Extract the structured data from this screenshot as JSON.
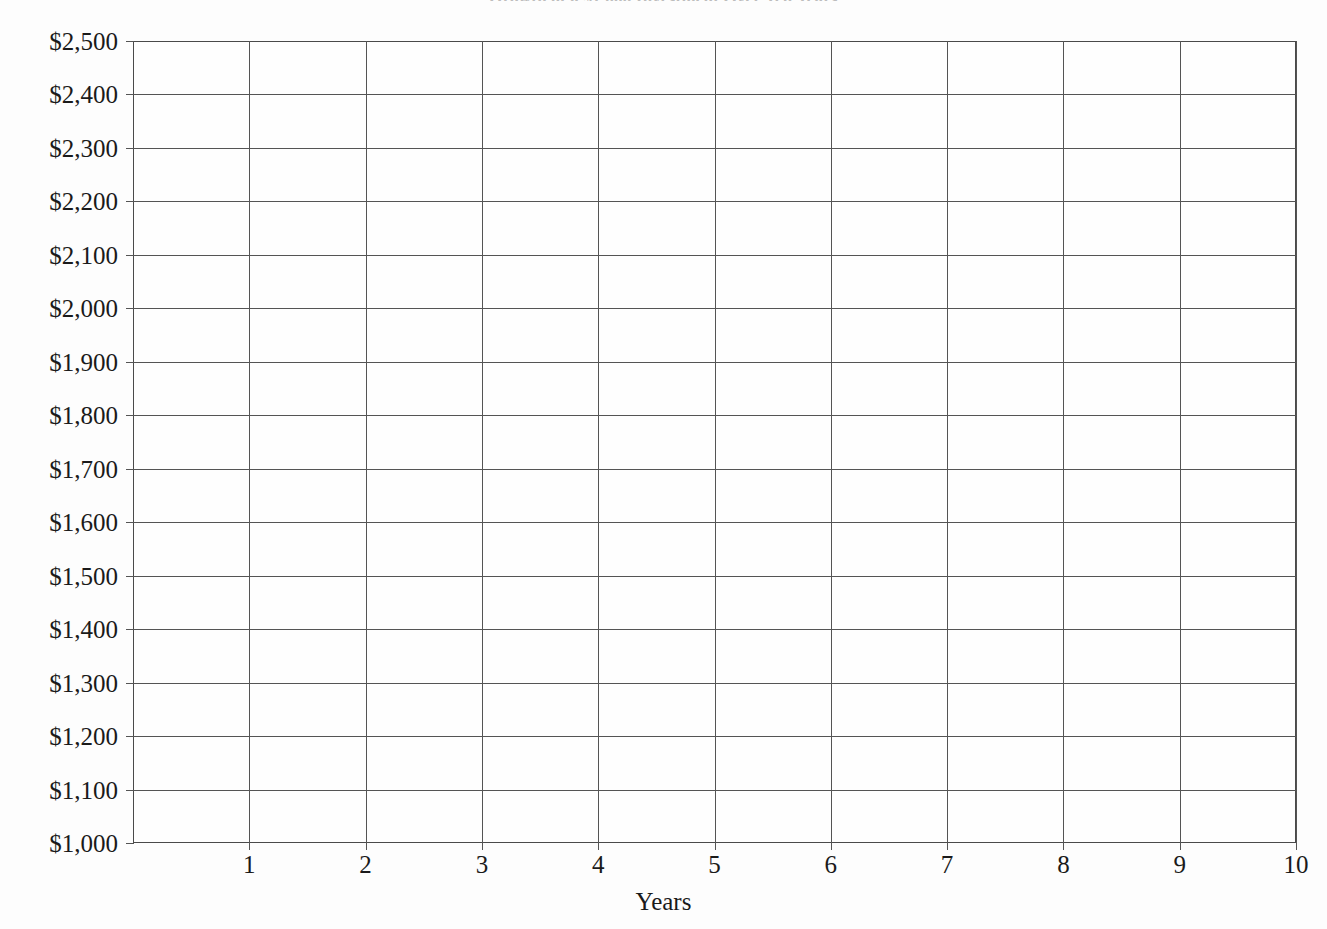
{
  "chart_data": {
    "type": "line",
    "title": "Growth of a $1,000 Investment Over Ten Years",
    "xlabel": "Years",
    "ylabel": "",
    "x": [
      0,
      1,
      2,
      3,
      4,
      5,
      6,
      7,
      8,
      9,
      10
    ],
    "series": [],
    "values": [],
    "categories": [],
    "xlim": [
      0,
      10
    ],
    "ylim": [
      1000,
      2500
    ],
    "xticks": [
      1,
      2,
      3,
      4,
      5,
      6,
      7,
      8,
      9,
      10
    ],
    "xtick_labels": [
      "1",
      "2",
      "3",
      "4",
      "5",
      "6",
      "7",
      "8",
      "9",
      "10"
    ],
    "yticks": [
      2500,
      2400,
      2300,
      2200,
      2100,
      2000,
      1900,
      1800,
      1700,
      1600,
      1500,
      1400,
      1300,
      1200,
      1100,
      1000
    ],
    "ytick_labels": [
      "$2,500",
      "$2,400",
      "$2,300",
      "$2,200",
      "$2,100",
      "$2,000",
      "$1,900",
      "$1,800",
      "$1,700",
      "$1,600",
      "$1,500",
      "$1,400",
      "$1,300",
      "$1,200",
      "$1,100",
      "$1,000"
    ],
    "grid": true,
    "legend": null,
    "annotations": [],
    "note": "Blank plotting grid — no data series are drawn in the figure.",
    "colors": {
      "grid": "#545454",
      "axis": "#4a4a4a",
      "text": "#1a1a1a",
      "background": "#fdfdfd"
    }
  }
}
